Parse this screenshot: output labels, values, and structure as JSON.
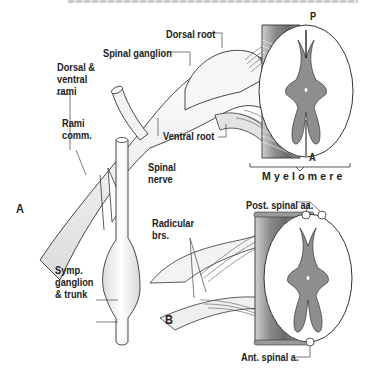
{
  "figure": {
    "top_caption_cutoff": "",
    "panels": [
      {
        "id": "A",
        "label": "A"
      },
      {
        "id": "B",
        "label": "B"
      }
    ]
  },
  "panel_a": {
    "letter": "A",
    "labels": {
      "dorsal_root": "Dorsal root",
      "spinal_ganglion": "Spinal ganglion",
      "dorsal_ventral_rami": "Dorsal &\nventral\nrami",
      "rami_comm": "Rami\ncomm.",
      "ventral_root": "Ventral root",
      "spinal_nerve": "Spinal\nnerve",
      "symp_ganglion": "Symp.\nganglion\n& trunk",
      "posterior_marker": "P",
      "anterior_marker": "A",
      "myelomere": "Myelomere"
    }
  },
  "panel_b": {
    "letter": "B",
    "labels": {
      "radicular_brs": "Radicular\nbrs.",
      "post_spinal_aa": "Post. spinal aa.",
      "ant_spinal_a": "Ant. spinal a."
    }
  },
  "colors": {
    "gray_matter": "#8e8e8e",
    "white_matter": "#ffffff",
    "outline": "#333333",
    "nerve_fill": "#f1f1f1",
    "label_text": "#222222",
    "leader_line": "#444444"
  }
}
